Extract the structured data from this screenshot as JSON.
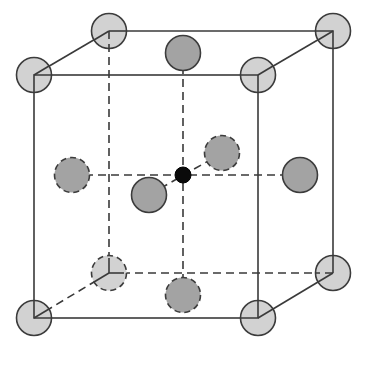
{
  "diagram": {
    "colors": {
      "corner_atom": "#d2d2d2",
      "face_atom": "#a3a3a3",
      "center_atom": "#0a0a0a",
      "edge": "#3a3a3a"
    },
    "atoms": {
      "corners": [
        {
          "label": "front-top-left",
          "hidden": false
        },
        {
          "label": "front-top-right",
          "hidden": false
        },
        {
          "label": "front-bottom-left",
          "hidden": false
        },
        {
          "label": "front-bottom-right",
          "hidden": false
        },
        {
          "label": "back-top-left",
          "hidden": false
        },
        {
          "label": "back-top-right",
          "hidden": false
        },
        {
          "label": "back-bottom-left",
          "hidden": true
        },
        {
          "label": "back-bottom-right",
          "hidden": false
        }
      ],
      "face_centers": [
        {
          "label": "top",
          "hidden": false
        },
        {
          "label": "bottom",
          "hidden": true
        },
        {
          "label": "left",
          "hidden": true
        },
        {
          "label": "right",
          "hidden": false
        },
        {
          "label": "front",
          "hidden": false
        },
        {
          "label": "back",
          "hidden": true
        }
      ],
      "interstitial": {
        "label": "body-center octahedral site"
      }
    }
  }
}
